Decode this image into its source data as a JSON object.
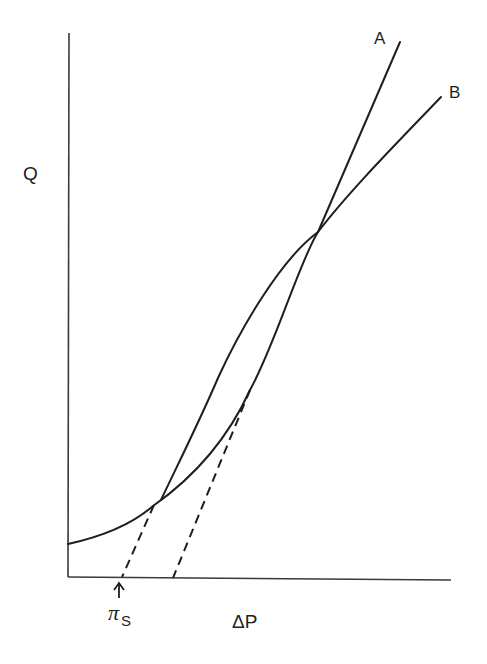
{
  "diagram": {
    "y_axis_label": "Q",
    "x_axis_label": "ΔP",
    "marker_label": {
      "symbol": "π",
      "subscript": "S"
    },
    "curves": [
      {
        "id": "A",
        "label": "A",
        "style": "solid",
        "shape": "linear",
        "extrapolation": "dashed line to ΔP axis at π_S"
      },
      {
        "id": "B",
        "label": "B",
        "style": "solid",
        "shape": "curved (convex at low ΔP, nearly linear at high ΔP)",
        "asymptote": "dashed tangent line to ΔP axis"
      }
    ],
    "colors": {
      "line": "#1e1e1e",
      "axis": "#3a3a3a",
      "background": "#ffffff"
    }
  }
}
